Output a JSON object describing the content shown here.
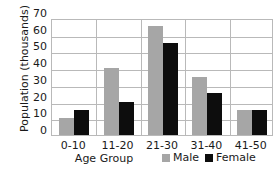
{
  "chart_data": {
    "type": "bar",
    "title": "",
    "subtitle": "",
    "xlabel": "Age Group",
    "ylabel": "Population (thousands)",
    "categories": [
      "0-10",
      "11-20",
      "21-30",
      "31-40",
      "41-50"
    ],
    "series": [
      {
        "name": "Male",
        "color": "#a6a6a6",
        "values": [
          10,
          40,
          65,
          35,
          15
        ]
      },
      {
        "name": "Female",
        "color": "#0d0d0d",
        "values": [
          15,
          20,
          55,
          25,
          15
        ]
      }
    ],
    "ylim": [
      0,
      70
    ],
    "yticks": [
      0,
      10,
      20,
      30,
      40,
      50,
      60,
      70
    ],
    "ytick_labels": [
      "0",
      "10",
      "20",
      "30",
      "40",
      "50",
      "60",
      "70"
    ],
    "grid": {
      "horizontal": true,
      "vertical": true
    },
    "legend": {
      "position": "bottom-right",
      "entries": [
        "Male",
        "Female"
      ]
    },
    "annotations": [],
    "colors": {
      "grid": "#b9b9b9",
      "axis_text": "#1a1a1a",
      "background": "#ffffff"
    }
  }
}
